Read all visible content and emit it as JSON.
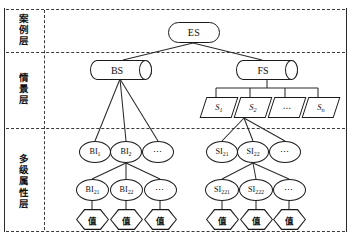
{
  "figure": {
    "type": "tree-diagram",
    "colors": {
      "stroke": "#1a1a1a",
      "divider": "#3a3a3a",
      "background": "#ffffff"
    }
  },
  "layers": [
    {
      "id": "case",
      "label": "案例层"
    },
    {
      "id": "scenario",
      "label": "情景层"
    },
    {
      "id": "attribute",
      "label": "多级属性层"
    }
  ],
  "nodes": {
    "root": {
      "label": "ES",
      "shape": "stadium"
    },
    "stores": [
      {
        "label": "BS",
        "shape": "cylinder"
      },
      {
        "label": "FS",
        "shape": "cylinder"
      }
    ],
    "scenarios": [
      {
        "label": "S",
        "sub": "1",
        "shape": "parallelogram"
      },
      {
        "label": "S",
        "sub": "2",
        "shape": "parallelogram"
      },
      {
        "label": "⋯",
        "sub": "",
        "shape": "parallelogram"
      },
      {
        "label": "S",
        "sub": "n",
        "shape": "parallelogram"
      }
    ],
    "level1_left": [
      {
        "label": "BI",
        "sub": "1",
        "shape": "circle"
      },
      {
        "label": "BI",
        "sub": "2",
        "shape": "circle"
      },
      {
        "label": "⋯",
        "sub": "",
        "shape": "circle"
      }
    ],
    "level1_right": [
      {
        "label": "SI",
        "sub": "21",
        "shape": "circle"
      },
      {
        "label": "SI",
        "sub": "22",
        "shape": "circle"
      },
      {
        "label": "⋯",
        "sub": "",
        "shape": "circle"
      }
    ],
    "level2_left": [
      {
        "label": "BI",
        "sub": "21",
        "shape": "circle"
      },
      {
        "label": "BI",
        "sub": "22",
        "shape": "circle"
      },
      {
        "label": "⋯",
        "sub": "",
        "shape": "circle"
      }
    ],
    "level2_right": [
      {
        "label": "SI",
        "sub": "221",
        "shape": "circle"
      },
      {
        "label": "SI",
        "sub": "222",
        "shape": "circle"
      },
      {
        "label": "⋯",
        "sub": "",
        "shape": "circle"
      }
    ],
    "values_left": [
      {
        "label": "值",
        "shape": "hexagon"
      },
      {
        "label": "值",
        "shape": "hexagon"
      },
      {
        "label": "值",
        "shape": "hexagon"
      }
    ],
    "values_right": [
      {
        "label": "值",
        "shape": "hexagon"
      },
      {
        "label": "值",
        "shape": "hexagon"
      },
      {
        "label": "值",
        "shape": "hexagon"
      }
    ]
  }
}
